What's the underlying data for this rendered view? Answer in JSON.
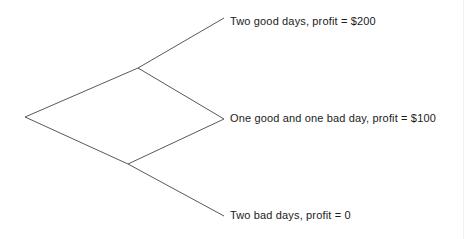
{
  "figure": {
    "type": "decision-tree-diagram",
    "background_color": "#ffffff",
    "line_color": "#555a5e",
    "text_color": "#1b1b1b"
  },
  "diagram": {
    "nodes": {
      "root": {
        "x": 25,
        "y": 117
      },
      "upper_branch": {
        "x": 138,
        "y": 68
      },
      "lower_branch": {
        "x": 128,
        "y": 164
      },
      "leaf_top": {
        "x": 224,
        "y": 18
      },
      "leaf_middle": {
        "x": 224,
        "y": 119
      },
      "leaf_bottom": {
        "x": 224,
        "y": 216
      }
    },
    "edges": [
      {
        "name": "root-to-upper",
        "from": "root",
        "to": "upper_branch"
      },
      {
        "name": "root-to-lower",
        "from": "root",
        "to": "lower_branch"
      },
      {
        "name": "upper-to-leaf-top",
        "from": "upper_branch",
        "to": "leaf_top"
      },
      {
        "name": "upper-to-leaf-middle",
        "from": "upper_branch",
        "to": "leaf_middle"
      },
      {
        "name": "lower-to-leaf-middle",
        "from": "lower_branch",
        "to": "leaf_middle"
      },
      {
        "name": "lower-to-leaf-bottom",
        "from": "lower_branch",
        "to": "leaf_bottom"
      }
    ]
  },
  "labels": {
    "top": "Two good days, profit = $200",
    "middle": "One good and one bad day, profit = $100",
    "bottom": "Two bad days, profit = 0"
  }
}
